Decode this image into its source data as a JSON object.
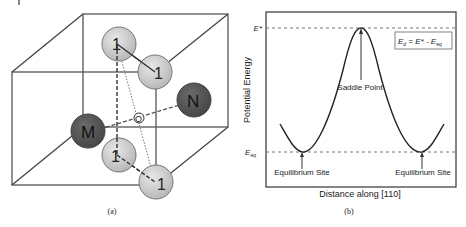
{
  "panel_a": {
    "caption": "(a)",
    "atoms": {
      "site1_top_back": "1",
      "site1_top_front": "1",
      "site1_bottom_back": "1",
      "site1_bottom_front": "1",
      "M": "M",
      "N": "N",
      "O": "O"
    },
    "colors": {
      "light_atom": "#c8c8c8",
      "dark_atom": "#555555",
      "edge": "#555555"
    }
  },
  "panel_b": {
    "caption": "(b)",
    "ylabel": "Potential Energy",
    "xlabel": "Distance along [110]",
    "tick_top": "E*",
    "tick_bottom_main": "E",
    "tick_bottom_sub": "eq",
    "annotation_saddle": "Saddle Point",
    "annotation_eq_left": "Equilibrium Site",
    "annotation_eq_right": "Equilibrium Site",
    "formula": {
      "lhs_main": "E",
      "lhs_sub": "d",
      "middle": " = E* - ",
      "rhs_main": "E",
      "rhs_sub": "eq"
    }
  }
}
